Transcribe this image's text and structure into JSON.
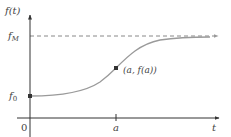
{
  "diagram": {
    "type": "logistic-curve",
    "axes": {
      "y_label": "f(t)",
      "x_label": "t",
      "origin_label": "0"
    },
    "labels": {
      "f_max": "f",
      "f_max_sub": "M",
      "f_zero": "f",
      "f_zero_sub": "0",
      "x_tick": "a",
      "point": "(a, f(a))"
    },
    "colors": {
      "axis": "#333333",
      "curve": "#9a9a9a",
      "dashed": "#888888",
      "point": "#333333",
      "text": "#444444"
    },
    "geometry": {
      "origin_x": 30,
      "axis_y": 118,
      "y_axis_top": 16,
      "x_axis_right": 219,
      "f_max_y": 36,
      "f_zero_y": 96,
      "inflection_x": 116,
      "inflection_y": 68
    }
  }
}
